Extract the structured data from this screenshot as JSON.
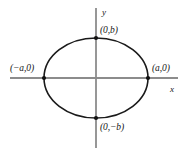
{
  "figure": {
    "type": "ellipse-diagram",
    "title": "",
    "axes": {
      "x_label": "x",
      "y_label": "y",
      "axis_color": "#8c8c8c",
      "x_axis_y": 78,
      "x_axis_from": 10,
      "x_axis_to": 178,
      "y_axis_x": 96,
      "y_axis_from": 8,
      "y_axis_to": 148
    },
    "curve": {
      "shape": "ellipse",
      "center_x": 96,
      "center_y": 78,
      "semi_axis_a": 52,
      "semi_axis_b": 40,
      "stroke_color": "#1a1a1a",
      "stroke_width": 1.6,
      "fill": "none"
    },
    "points": [
      {
        "name": "top-vertex",
        "label": "(0,b)",
        "cx": 96,
        "cy": 38
      },
      {
        "name": "right-vertex",
        "label": "(a,0)",
        "cx": 148,
        "cy": 78
      },
      {
        "name": "bottom-vertex",
        "label": "(0,−b)",
        "cx": 96,
        "cy": 118
      },
      {
        "name": "left-vertex",
        "label": "(−a,0)",
        "cx": 44,
        "cy": 78
      }
    ],
    "point_color": "#111111",
    "background": "#ffffff"
  },
  "chart_data": {
    "type": "scatter",
    "title": "",
    "xlabel": "x",
    "ylabel": "y",
    "grid": false,
    "legend": null,
    "annotations": [
      "(0,b)",
      "(a,0)",
      "(0,−b)",
      "(−a,0)"
    ],
    "curve_equation": "x^2/a^2 + y^2/b^2 = 1",
    "marked_points": [
      {
        "label": "(0,b)",
        "x": 0,
        "y": "b"
      },
      {
        "label": "(a,0)",
        "x": "a",
        "y": 0
      },
      {
        "label": "(0,-b)",
        "x": 0,
        "y": "-b"
      },
      {
        "label": "(-a,0)",
        "x": "-a",
        "y": 0
      }
    ]
  }
}
